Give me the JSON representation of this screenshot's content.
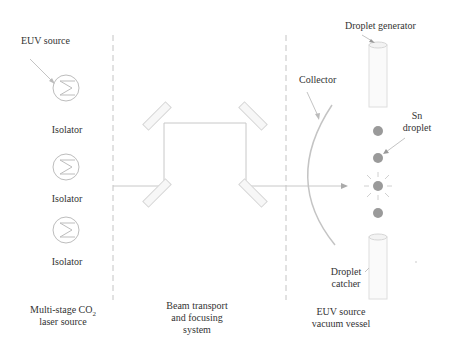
{
  "diagram": {
    "sections": [
      {
        "name": "laser-source",
        "label_line1": "Multi-stage CO",
        "label_sub": "2",
        "label_line2": "laser source"
      },
      {
        "name": "beam-transport",
        "label_line1": "Beam transport",
        "label_line2": "and focusing",
        "label_line3": "system"
      },
      {
        "name": "vacuum-vessel",
        "label_line1": "EUV source",
        "label_line2": "vacuum vessel"
      }
    ],
    "labels": {
      "euv_source": "EUV source",
      "isolators": [
        "Isolator",
        "Isolator",
        "Isolator"
      ],
      "collector": "Collector",
      "droplet_generator": "Droplet generator",
      "sn_droplet_line1": "Sn",
      "sn_droplet_line2": "droplet",
      "droplet_catcher_line1": "Droplet",
      "droplet_catcher_line2": "catcher"
    },
    "colors": {
      "line": "#c8c8c8",
      "dashed": "#bdbdbd",
      "droplet": "#9a9a9a",
      "text": "#333333"
    }
  }
}
